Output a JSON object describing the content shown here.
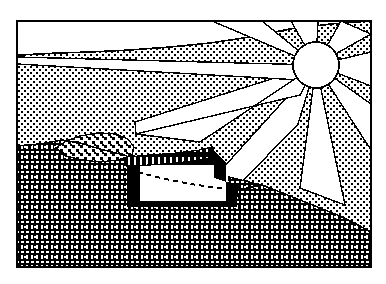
{
  "figure": {
    "title": "Passive solar earth-sheltered structure cross-section",
    "kind": "line-art-diagram",
    "width": 386,
    "height": 284,
    "background_color": "#ffffff",
    "ink_color": "#000000",
    "frame": {
      "name": "illustration-border",
      "x": 16,
      "y": 20,
      "width": 356,
      "height": 248,
      "stroke_width": 2,
      "stroke_color": "#000000",
      "fill_color": "#ffffff"
    },
    "elements": [
      {
        "name": "sun-disc",
        "label": "Sun",
        "shape": "circle",
        "cx": 316,
        "cy": 65,
        "r": 23,
        "fill": "#ffffff",
        "stroke": "#000000"
      },
      {
        "name": "sun-rays",
        "label": "Sun rays",
        "count": 9,
        "fill": "#ffffff",
        "note": "white wedges radiating from sun disc"
      },
      {
        "name": "sky-stipple",
        "label": "Stippled sky / atmosphere",
        "pattern": "fine-dot-stipple",
        "fill": "#ffffff",
        "dot_color": "#000000"
      },
      {
        "name": "bedrock-hatch",
        "label": "Earth / bedrock mass",
        "pattern": "brick-weave-hatch",
        "fill": "#000000",
        "tick_color": "#ffffff"
      },
      {
        "name": "gravel-deposit",
        "label": "Gravel / rubble deposit on slope",
        "pattern": "coarse-stipple",
        "fill": "#ffffff",
        "dot_color": "#000000"
      },
      {
        "name": "shelter-structure",
        "label": "Earth-sheltered structure",
        "fill": "#000000",
        "interior_fill": "#ffffff"
      },
      {
        "name": "shelter-roof-beam",
        "label": "Roof beam with tie marks",
        "pattern": "ticked-band",
        "fill": "#000000",
        "tick_color": "#ffffff"
      },
      {
        "name": "shelter-interior",
        "label": "Interior void",
        "fill": "#ffffff"
      },
      {
        "name": "interior-dashed-curve",
        "label": "Dashed reference curve inside structure",
        "stroke": "#000000",
        "dash": "5 4",
        "stroke_width": 2
      },
      {
        "name": "glazing-panel",
        "label": "South-facing glazing panel",
        "fill": "#000000"
      },
      {
        "name": "horizon-line",
        "label": "Horizon / sky-ground boundary",
        "stroke": "#000000"
      },
      {
        "name": "ground-line",
        "label": "Ground surface profile",
        "stroke": "#000000"
      }
    ],
    "colors": {
      "ink": "#000000",
      "paper": "#ffffff",
      "stipple_gray": "#d8d8d8",
      "hatch_gray": "#404040"
    }
  }
}
